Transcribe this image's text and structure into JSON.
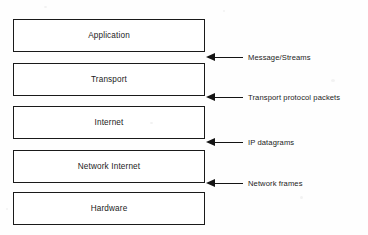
{
  "diagram": {
    "type": "layered-stack",
    "colors": {
      "background": "#fefefe",
      "box_fill": "#ffffff",
      "box_border": "#1a1a1a",
      "text": "#1b1b1b",
      "arrow": "#141414"
    },
    "layers": [
      {
        "id": "application",
        "label": "Application"
      },
      {
        "id": "transport",
        "label": "Transport"
      },
      {
        "id": "internet",
        "label": "Internet"
      },
      {
        "id": "network-internet",
        "label": "Network Internet"
      },
      {
        "id": "hardware",
        "label": "Hardware"
      }
    ],
    "annotations": [
      {
        "id": "message-streams",
        "label": "Message/Streams",
        "icon": "arrow-left-icon",
        "between": [
          "application",
          "transport"
        ]
      },
      {
        "id": "transport-protocol-packets",
        "label": "Transport protocol packets",
        "icon": "arrow-left-icon",
        "between": [
          "transport",
          "internet"
        ]
      },
      {
        "id": "ip-datagrams",
        "label": "IP datagrams",
        "icon": "arrow-left-icon",
        "between": [
          "internet",
          "network-internet"
        ]
      },
      {
        "id": "network-frames",
        "label": "Network frames",
        "icon": "arrow-left-icon",
        "between": [
          "network-internet",
          "hardware"
        ]
      }
    ]
  }
}
